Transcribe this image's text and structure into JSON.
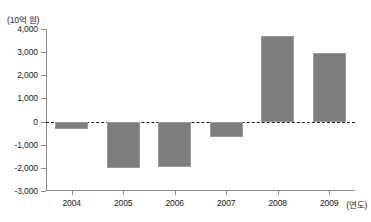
{
  "chart_data": {
    "type": "bar",
    "title": "",
    "subtitle": "",
    "unit_label": "(10억 원)",
    "xlabel": "(연도)",
    "ylabel": "",
    "categories": [
      "2004",
      "2005",
      "2006",
      "2007",
      "2008",
      "2009"
    ],
    "values": [
      -300,
      -2000,
      -1950,
      -650,
      3700,
      2980
    ],
    "series": [
      {
        "name": "",
        "values": [
          -300,
          -2000,
          -1950,
          -650,
          3700,
          2980
        ]
      }
    ],
    "ylim": [
      -3000,
      4000
    ],
    "ytick_values": [
      4000,
      3000,
      2000,
      1000,
      0,
      -1000,
      -2000,
      -3000
    ],
    "ytick_labels": [
      "4,000",
      "3,000",
      "2,000",
      "1,000",
      "0",
      "-1,000",
      "-2,000",
      "-3,000"
    ],
    "xtick_labels": [
      "2004",
      "2005",
      "2006",
      "2007",
      "2008",
      "2009"
    ],
    "grid": false,
    "zero_line": true,
    "zero_line_style": "dashed",
    "legend": null,
    "legend_position": "none",
    "bar_color": "#7d7d7d",
    "axis_color": "#8a8a8a",
    "text_color": "#1a1a1a",
    "background_color": "#ffffff"
  }
}
